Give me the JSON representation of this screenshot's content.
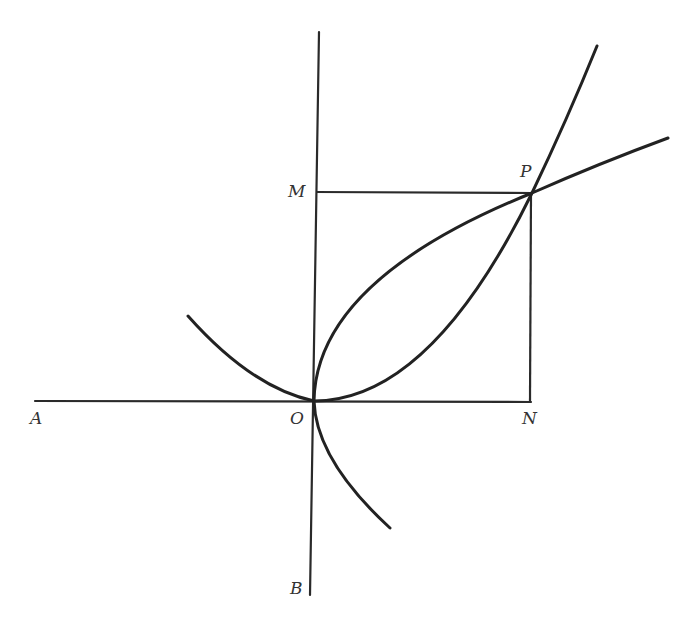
{
  "diagram": {
    "type": "geometry",
    "colors": {
      "ink": "#222222",
      "background": "#ffffff"
    },
    "labels": {
      "A": "A",
      "B": "B",
      "O": "O",
      "M": "M",
      "N": "N",
      "P": "P"
    },
    "points": {
      "O": {
        "x": 314,
        "y": 401
      },
      "P": {
        "x": 532,
        "y": 193
      },
      "M": {
        "x": 316,
        "y": 193
      },
      "N": {
        "x": 531,
        "y": 401
      }
    },
    "lines": [
      {
        "name": "horizontal-axis",
        "from": "A",
        "to": "N"
      },
      {
        "name": "vertical-axis",
        "from": "top",
        "to": "B"
      },
      {
        "name": "segment-MP",
        "from": "M",
        "to": "P"
      },
      {
        "name": "segment-PN",
        "from": "P",
        "to": "N"
      }
    ],
    "curves": [
      {
        "name": "parabola-upward",
        "equation": "y = x^2 / a",
        "passes_through": [
          "O",
          "P"
        ]
      },
      {
        "name": "parabola-rightward",
        "equation": "x = y^2 / a",
        "passes_through": [
          "O",
          "P"
        ]
      }
    ]
  }
}
